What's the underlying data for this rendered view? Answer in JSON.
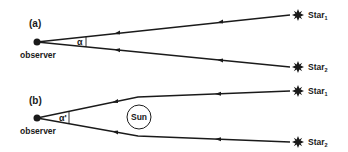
{
  "panels": {
    "a": {
      "label": "(a)",
      "observer_label": "observer",
      "angle_label": "α",
      "star1": {
        "name": "Star",
        "sub": "1"
      },
      "star2": {
        "name": "Star",
        "sub": "2"
      }
    },
    "b": {
      "label": "(b)",
      "observer_label": "observer",
      "angle_label": "α'",
      "sun_label": "Sun",
      "star1": {
        "name": "Star",
        "sub": "1"
      },
      "star2": {
        "name": "Star",
        "sub": "2"
      }
    }
  },
  "colors": {
    "ink": "#1a1a1a",
    "background": "#ffffff"
  }
}
